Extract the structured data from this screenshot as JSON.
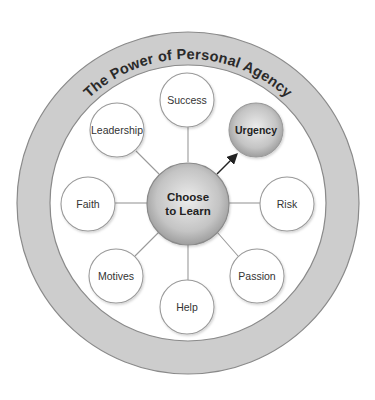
{
  "title": "The Power of Personal Agency",
  "center": {
    "label_line1": "Choose",
    "label_line2": "to Learn"
  },
  "nodes": [
    {
      "label": "Success",
      "highlighted": false
    },
    {
      "label": "Urgency",
      "highlighted": true
    },
    {
      "label": "Risk",
      "highlighted": false
    },
    {
      "label": "Passion",
      "highlighted": false
    },
    {
      "label": "Help",
      "highlighted": false
    },
    {
      "label": "Motives",
      "highlighted": false
    },
    {
      "label": "Faith",
      "highlighted": false
    },
    {
      "label": "Leadership",
      "highlighted": false
    }
  ],
  "colors": {
    "ring_fill": "#cdcdcd",
    "ring_stroke": "#8a8a8a",
    "node_stroke": "#9a9a9a",
    "connector": "#9a9a9a",
    "arrow": "#222222",
    "center_fill": "#bdbdbd",
    "text": "#333333"
  }
}
